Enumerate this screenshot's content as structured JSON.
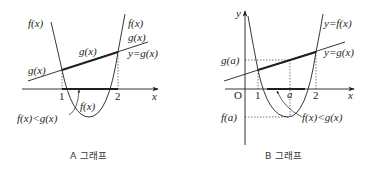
{
  "graph_a": {
    "caption": "A 그래프",
    "labels": {
      "f_left": "f(x)",
      "f_right": "f(x)",
      "g_left": "g(x)",
      "g_mid": "g(x)",
      "g_right": "g(x)",
      "line_eq": "y=g(x)",
      "f_bottom": "f(x)",
      "inequality": "f(x)<g(x)",
      "tick_1": "1",
      "tick_2": "2",
      "x_axis": "x"
    }
  },
  "graph_b": {
    "caption": "B 그래프",
    "labels": {
      "y_axis": "y",
      "x_axis": "x",
      "origin": "O",
      "tick_1": "1",
      "tick_a": "a",
      "tick_2": "2",
      "g_a": "g(a)",
      "f_a": "f(a)",
      "curve_eq": "y=f(x)",
      "line_eq": "y=g(x)",
      "inequality": "f(x)<g(x)"
    }
  },
  "colors": {
    "stroke": "#231f20",
    "caption": "#3a3a3a"
  }
}
